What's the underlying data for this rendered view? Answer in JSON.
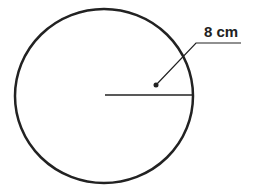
{
  "diagram": {
    "shape": "circle",
    "radius_label": "8 cm",
    "colors": {
      "stroke": "#222222",
      "background": "#ffffff"
    }
  }
}
